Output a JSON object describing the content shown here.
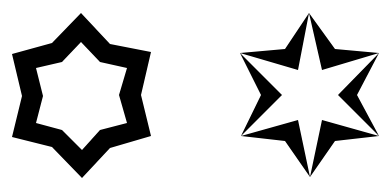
{
  "figure": {
    "background": "#ffffff",
    "ink": "#000000",
    "shapes": [
      {
        "name": "hollow-hexagram-outline",
        "description": "Six-pointed star outline with thick black band and white interior",
        "outer_points": [
          [
            81,
            13
          ],
          [
            110,
            44
          ],
          [
            151,
            52
          ],
          [
            141,
            95
          ],
          [
            151,
            136
          ],
          [
            110,
            148
          ],
          [
            82,
            178
          ],
          [
            52,
            147
          ],
          [
            12,
            137
          ],
          [
            22,
            96
          ],
          [
            12,
            54
          ],
          [
            52,
            43
          ]
        ],
        "inner_points": [
          [
            81,
            42
          ],
          [
            100,
            62
          ],
          [
            127,
            68
          ],
          [
            119,
            95
          ],
          [
            127,
            123
          ],
          [
            100,
            130
          ],
          [
            82,
            150
          ],
          [
            62,
            130
          ],
          [
            36,
            123
          ],
          [
            43,
            96
          ],
          [
            36,
            68
          ],
          [
            62,
            62
          ]
        ]
      },
      {
        "name": "layered-hexagram",
        "description": "Black six-pointed star with a white six-pointed star inset sharing its tips",
        "outer_points": [
          [
            309,
            13
          ],
          [
            335,
            49
          ],
          [
            379,
            53
          ],
          [
            357,
            95
          ],
          [
            379,
            136
          ],
          [
            335,
            141
          ],
          [
            310,
            177
          ],
          [
            285,
            141
          ],
          [
            241,
            136
          ],
          [
            261,
            95
          ],
          [
            240,
            53
          ],
          [
            285,
            49
          ]
        ],
        "inner_points": [
          [
            309,
            13
          ],
          [
            322,
            70
          ],
          [
            379,
            53
          ],
          [
            338,
            95
          ],
          [
            379,
            136
          ],
          [
            322,
            120
          ],
          [
            310,
            177
          ],
          [
            298,
            120
          ],
          [
            241,
            136
          ],
          [
            282,
            95
          ],
          [
            240,
            53
          ],
          [
            298,
            70
          ]
        ]
      }
    ]
  }
}
